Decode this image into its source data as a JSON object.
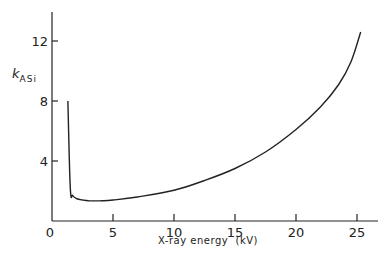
{
  "chart_data": {
    "type": "line",
    "title": "",
    "xlabel": "X-ray energy  (kV)",
    "ylabel": "k",
    "ylabel_subscript": "ASi",
    "xlim": [
      0,
      27
    ],
    "ylim": [
      0,
      14
    ],
    "x_ticks": [
      "0",
      "5",
      "10",
      "15",
      "20",
      "25"
    ],
    "y_ticks": [
      "4",
      "8",
      "12"
    ],
    "grid": false,
    "legend": "none",
    "series": [
      {
        "name": "kASi",
        "x": [
          1.3,
          1.5,
          1.7,
          2.0,
          2.5,
          3.0,
          4.0,
          5.0,
          7.0,
          10.0,
          12.5,
          15.0,
          17.5,
          20.0,
          22.0,
          23.5,
          24.5,
          25.3
        ],
        "y": [
          8.0,
          2.2,
          1.7,
          1.5,
          1.4,
          1.35,
          1.35,
          1.4,
          1.6,
          2.05,
          2.7,
          3.5,
          4.6,
          6.1,
          7.6,
          9.1,
          10.6,
          12.6
        ]
      }
    ]
  }
}
